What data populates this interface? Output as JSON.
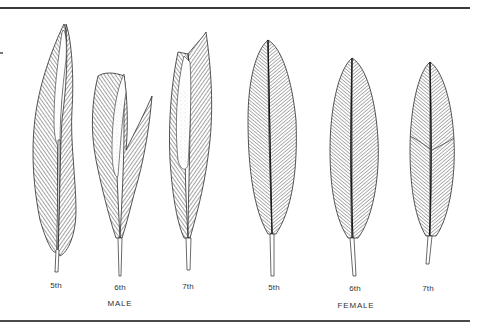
{
  "figure": {
    "feathers": [
      {
        "label": "5th",
        "sex": "male",
        "x": 56,
        "label_y": 286
      },
      {
        "label": "6th",
        "sex": "male",
        "x": 120,
        "label_y": 288
      },
      {
        "label": "7th",
        "sex": "male",
        "x": 188,
        "label_y": 287
      },
      {
        "label": "5th",
        "sex": "female",
        "x": 274,
        "label_y": 288
      },
      {
        "label": "6th",
        "sex": "female",
        "x": 354,
        "label_y": 289
      },
      {
        "label": "7th",
        "sex": "female",
        "x": 428,
        "label_y": 289
      }
    ],
    "groups": [
      {
        "label": "MALE",
        "x": 120,
        "y": 303
      },
      {
        "label": "FEMALE",
        "x": 356,
        "y": 305
      }
    ],
    "colors": {
      "ink": "#2a2a2a",
      "rule": "#3a3a3a",
      "background": "#ffffff"
    }
  }
}
